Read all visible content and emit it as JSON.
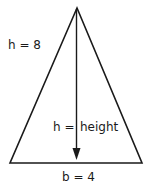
{
  "figure": {
    "type": "triangle-height-diagram",
    "labels": {
      "height_value": "h = 8",
      "height_definition": "h = height",
      "height_def_left": "h =",
      "height_def_right": "height",
      "base_value": "b = 4"
    },
    "values": {
      "h": 8,
      "b": 4
    },
    "colors": {
      "stroke": "#1a1a1a",
      "background": "#ffffff"
    }
  }
}
